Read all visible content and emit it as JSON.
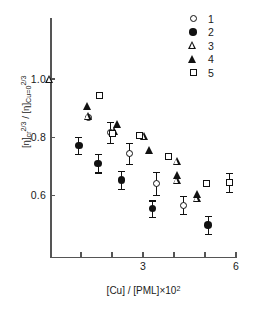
{
  "chart_data": {
    "type": "scatter",
    "title": "",
    "xlabel": "[Cu] / [PML]×10²",
    "ylabel": "[η]cr2/3 / [η]Cu=02/3",
    "xlim": [
      0,
      6.2
    ],
    "ylim": [
      0.46,
      1.06
    ],
    "xticks": [
      1,
      2,
      3,
      4,
      5,
      6
    ],
    "xtick_labels": [
      "",
      "",
      "3",
      "",
      "",
      "6"
    ],
    "yticks": [
      0.6,
      0.8,
      1.0
    ],
    "ytick_labels": [
      "0.6",
      "0.8",
      "1.0"
    ],
    "grid": false,
    "legend_position": "top-right",
    "series": [
      {
        "name": "1",
        "marker": "open-circle",
        "points": [
          {
            "x": 1.25,
            "y": 0.868,
            "yerr": 0.0
          },
          {
            "x": 1.95,
            "y": 0.817,
            "yerr": 0.037
          },
          {
            "x": 2.55,
            "y": 0.745,
            "yerr": 0.036
          },
          {
            "x": 3.45,
            "y": 0.643,
            "yerr": 0.039
          },
          {
            "x": 4.3,
            "y": 0.568,
            "yerr": 0.031
          }
        ]
      },
      {
        "name": "2",
        "marker": "filled-circle",
        "points": [
          {
            "x": 0.93,
            "y": 0.772,
            "yerr": 0.028
          },
          {
            "x": 1.55,
            "y": 0.711,
            "yerr": 0.031
          },
          {
            "x": 2.3,
            "y": 0.654,
            "yerr": 0.031
          },
          {
            "x": 3.3,
            "y": 0.556,
            "yerr": 0.028
          },
          {
            "x": 5.1,
            "y": 0.5,
            "yerr": 0.031
          }
        ]
      },
      {
        "name": "3",
        "marker": "open-triangle",
        "points": [
          {
            "x": 0.0,
            "y": 1.0,
            "yerr": 0.0
          },
          {
            "x": 1.25,
            "y": 0.872,
            "yerr": 0.0
          },
          {
            "x": 2.08,
            "y": 0.822,
            "yerr": 0.0
          },
          {
            "x": 3.05,
            "y": 0.805,
            "yerr": 0.0
          },
          {
            "x": 4.12,
            "y": 0.718,
            "yerr": 0.0
          },
          {
            "x": 4.12,
            "y": 0.655,
            "yerr": 0.0
          },
          {
            "x": 4.75,
            "y": 0.592,
            "yerr": 0.0
          }
        ]
      },
      {
        "name": "4",
        "marker": "filled-triangle",
        "points": [
          {
            "x": 1.22,
            "y": 0.908,
            "yerr": 0.0
          },
          {
            "x": 2.18,
            "y": 0.845,
            "yerr": 0.0
          },
          {
            "x": 3.2,
            "y": 0.755,
            "yerr": 0.0
          },
          {
            "x": 4.12,
            "y": 0.672,
            "yerr": 0.0
          },
          {
            "x": 4.75,
            "y": 0.605,
            "yerr": 0.0
          }
        ]
      },
      {
        "name": "5",
        "marker": "open-square",
        "points": [
          {
            "x": 1.6,
            "y": 0.945,
            "yerr": 0.0
          },
          {
            "x": 2.02,
            "y": 0.812,
            "yerr": 0.0
          },
          {
            "x": 2.88,
            "y": 0.805,
            "yerr": 0.0
          },
          {
            "x": 3.82,
            "y": 0.733,
            "yerr": 0.0
          },
          {
            "x": 5.05,
            "y": 0.642,
            "yerr": 0.0
          },
          {
            "x": 5.8,
            "y": 0.645,
            "yerr": 0.032
          }
        ]
      }
    ]
  },
  "axes": {
    "y_label_parts": {
      "open1": "[η]",
      "sub1": "cr",
      "sup1": "2/3",
      "slash": " / ",
      "open2": "[η]",
      "sub2": "Cu=0",
      "sup2": "2/3"
    },
    "x_label_parts": {
      "main": "[Cu] / [PML]×10",
      "exp": "2"
    },
    "ytick_labels": [
      "1.0",
      "0.8",
      "0.6"
    ],
    "xtick_labels": [
      "3",
      "6"
    ]
  },
  "legend": {
    "items": [
      {
        "label": "1",
        "marker": "open-circle"
      },
      {
        "label": "2",
        "marker": "filled-circle"
      },
      {
        "label": "3",
        "marker": "open-triangle"
      },
      {
        "label": "4",
        "marker": "filled-triangle"
      },
      {
        "label": "5",
        "marker": "open-square"
      }
    ]
  }
}
